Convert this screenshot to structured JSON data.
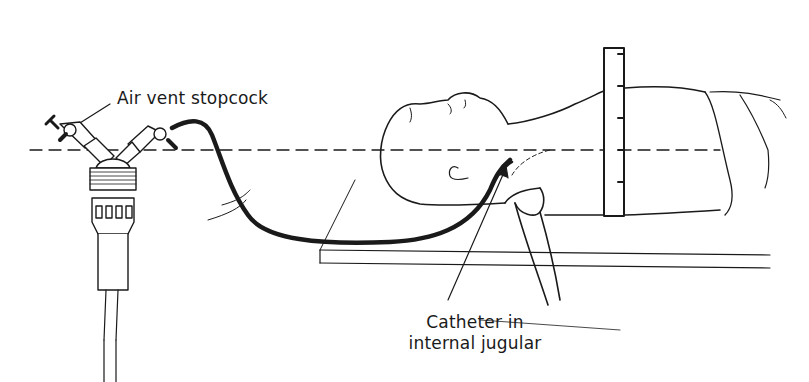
{
  "figure": {
    "type": "medical line illustration",
    "colors": {
      "ink": "#1a1a1a",
      "background": "#ffffff"
    }
  },
  "labels": {
    "air_vent": "Air vent stopcock",
    "catheter_line1": "Catheter in",
    "catheter_line2": "internal jugular"
  },
  "elements": {
    "transducer": "pressure transducer with two stopcocks",
    "tubing": "pressure tubing to patient",
    "reference_line": "dashed horizontal level line",
    "ruler": "vertical measuring scale",
    "patient": "supine patient on table",
    "ruler_ticks": 5
  }
}
